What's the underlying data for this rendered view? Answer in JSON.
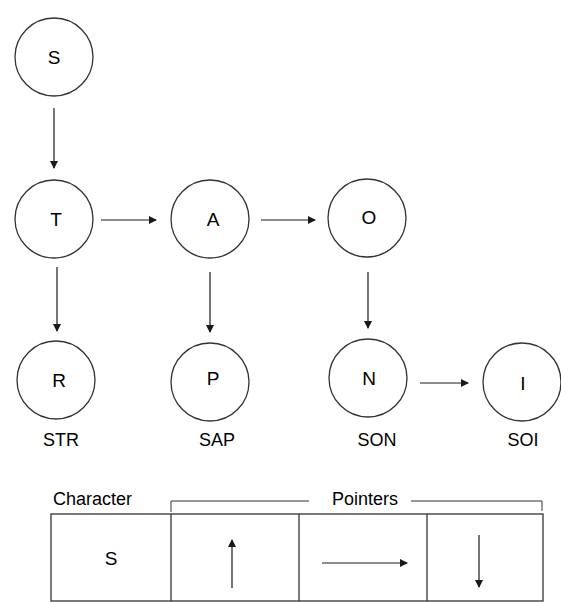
{
  "diagram": {
    "nodes": [
      {
        "id": "S",
        "label": "S",
        "cx": 54,
        "cy": 57
      },
      {
        "id": "T",
        "label": "T",
        "cx": 54,
        "cy": 219
      },
      {
        "id": "A",
        "label": "A",
        "cx": 210,
        "cy": 219
      },
      {
        "id": "O",
        "label": "O",
        "cx": 367,
        "cy": 218
      },
      {
        "id": "R",
        "label": "R",
        "cx": 56,
        "cy": 380
      },
      {
        "id": "P",
        "label": "P",
        "cx": 210,
        "cy": 382
      },
      {
        "id": "N",
        "label": "N",
        "cx": 368,
        "cy": 378
      },
      {
        "id": "I",
        "label": "I",
        "cx": 522,
        "cy": 382
      }
    ],
    "edges": [
      {
        "from": "S",
        "to": "T",
        "direction": "down"
      },
      {
        "from": "T",
        "to": "A",
        "direction": "right"
      },
      {
        "from": "A",
        "to": "O",
        "direction": "right"
      },
      {
        "from": "T",
        "to": "R",
        "direction": "down"
      },
      {
        "from": "A",
        "to": "P",
        "direction": "down"
      },
      {
        "from": "O",
        "to": "N",
        "direction": "down"
      },
      {
        "from": "N",
        "to": "I",
        "direction": "right"
      }
    ],
    "word_labels": [
      {
        "for": "R",
        "text": "STR"
      },
      {
        "for": "P",
        "text": "SAP"
      },
      {
        "for": "N",
        "text": "SON"
      },
      {
        "for": "I",
        "text": "SOI"
      }
    ]
  },
  "record": {
    "character_header": "Character",
    "pointers_header": "Pointers",
    "character_value": "S",
    "pointer_cells": [
      {
        "icon": "arrow-up-icon"
      },
      {
        "icon": "arrow-right-icon"
      },
      {
        "icon": "arrow-down-icon"
      }
    ]
  }
}
